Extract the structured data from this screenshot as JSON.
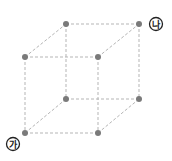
{
  "diagram": {
    "type": "cube-wireframe",
    "colors": {
      "edge": "#b5b5b5",
      "vertex": "#7a7a7a",
      "label": "#222222"
    },
    "vertices": [
      {
        "id": "back-top-left",
        "x": 66,
        "y": 24
      },
      {
        "id": "back-top-right",
        "x": 139,
        "y": 24
      },
      {
        "id": "front-top-left",
        "x": 25,
        "y": 57
      },
      {
        "id": "front-top-right",
        "x": 98,
        "y": 57
      },
      {
        "id": "back-bottom-left",
        "x": 66,
        "y": 99
      },
      {
        "id": "back-bottom-right",
        "x": 139,
        "y": 99
      },
      {
        "id": "front-bottom-left",
        "x": 25,
        "y": 133
      },
      {
        "id": "front-bottom-right",
        "x": 98,
        "y": 133
      }
    ],
    "labels": {
      "ga": {
        "text": "가",
        "vertex": "front-bottom-left"
      },
      "na": {
        "text": "나",
        "vertex": "back-top-right"
      }
    }
  }
}
